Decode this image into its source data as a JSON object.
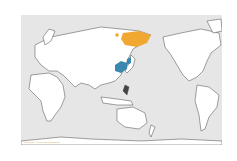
{
  "map": {
    "projection": "Pacific-centered world map",
    "background_color": "#e6e6e6",
    "land_color": "#ffffff",
    "border_color": "#555555",
    "legend": {
      "breeding_range": {
        "label": "Breeding range",
        "color": "#f0a830",
        "region": "Northeastern Siberia"
      },
      "wintering_range": {
        "label": "Wintering range",
        "color": "#3a87b0",
        "region": "Eastern China, Korea"
      }
    },
    "credit": "Range map © Cornell Lab of Ornithology"
  }
}
